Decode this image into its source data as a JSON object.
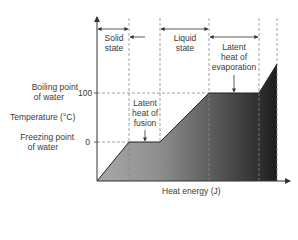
{
  "diagram": {
    "type": "heating curve of water",
    "y_axis": {
      "label": "Temperature (°C)",
      "ticks": [
        {
          "value": "100",
          "annotation": "Boiling point of water",
          "line1": "Boiling point",
          "line2": "of water"
        },
        {
          "value": "0",
          "annotation": "Freezing point of water",
          "line1": "Freezing point",
          "line2": "of water"
        }
      ]
    },
    "x_axis": {
      "label": "Heat energy (J)"
    },
    "regions": [
      {
        "line1": "Solid",
        "line2": "state"
      },
      {
        "line1": "Liquid",
        "line2": "state"
      },
      {
        "line1": "Latent",
        "line2": "heat of",
        "line3": "evaporation"
      }
    ],
    "plateaus": [
      {
        "line1": "Latent",
        "line2": "heat of",
        "line3": "fusion"
      }
    ],
    "colors": {
      "fill_light": "#9a9a9a",
      "fill_dark": "#2a2a2a",
      "line": "#333333",
      "dash": "#888888"
    }
  }
}
